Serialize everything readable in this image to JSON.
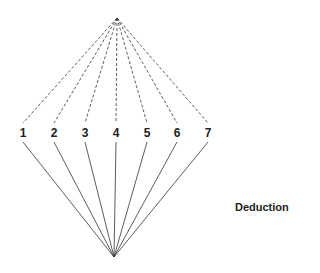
{
  "diagram": {
    "title": "Deduction",
    "top_apex": {
      "x": 117,
      "y": 18
    },
    "bottom_apex": {
      "x": 114,
      "y": 257
    },
    "nodes": [
      {
        "label": "1",
        "x": 23
      },
      {
        "label": "2",
        "x": 54
      },
      {
        "label": "3",
        "x": 85
      },
      {
        "label": "4",
        "x": 116
      },
      {
        "label": "5",
        "x": 147
      },
      {
        "label": "6",
        "x": 177
      },
      {
        "label": "7",
        "x": 208
      }
    ],
    "node_y": 133,
    "upper_edge_style": "dashed",
    "lower_edge_style": "solid",
    "line_color": "#333333"
  }
}
